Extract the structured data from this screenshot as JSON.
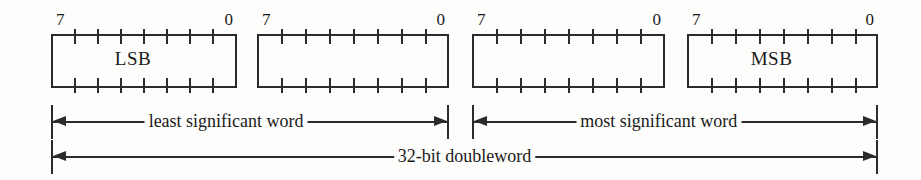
{
  "figure": {
    "name": "32-bit doubleword byte-ordering diagram",
    "background_color": "#fdfdfc",
    "ink_color": "#2b2b2b",
    "bytes": [
      {
        "msb_index": "7",
        "lsb_index": "0",
        "label": "LSB",
        "ticks": 7
      },
      {
        "msb_index": "7",
        "lsb_index": "0",
        "label": "",
        "ticks": 7
      },
      {
        "msb_index": "7",
        "lsb_index": "0",
        "label": "",
        "ticks": 7
      },
      {
        "msb_index": "7",
        "lsb_index": "0",
        "label": "MSB",
        "ticks": 7
      }
    ],
    "spans": [
      {
        "label": "least significant word"
      },
      {
        "label": "most significant word"
      },
      {
        "label": "32-bit doubleword"
      }
    ]
  }
}
